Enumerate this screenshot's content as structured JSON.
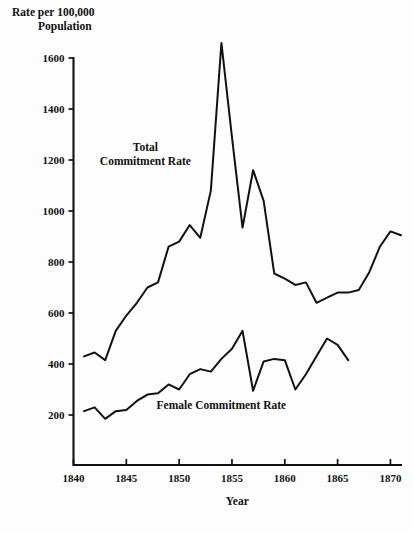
{
  "chart_data": {
    "type": "line",
    "title": "",
    "xlabel": "Year",
    "ylabel": "Rate per 100,000 Population",
    "ylabel_line1": "Rate per 100,000",
    "ylabel_line2": "Population",
    "xlim": [
      1840,
      1871
    ],
    "ylim": [
      100,
      1600
    ],
    "grid": false,
    "legend_position": "inline-annotation",
    "xticks": [
      1840,
      1845,
      1850,
      1855,
      1860,
      1865,
      1870
    ],
    "xtick_labels": [
      "1840",
      "1845",
      "1850",
      "1855",
      "1860",
      "1865",
      "1870"
    ],
    "yticks": [
      200,
      400,
      600,
      800,
      1000,
      1200,
      1400,
      1600
    ],
    "ytick_labels": [
      "200",
      "400",
      "600",
      "800",
      "1000",
      "1200",
      "1400",
      "1600"
    ],
    "line_color": "#111111",
    "series": [
      {
        "name": "Total Commitment Rate",
        "label_line1": "Total",
        "label_line2": "Commitment Rate",
        "label_x": 1846.8,
        "label_y": 1235,
        "x": [
          1841,
          1842,
          1843,
          1844,
          1845,
          1846,
          1847,
          1848,
          1849,
          1850,
          1851,
          1852,
          1853,
          1854,
          1855,
          1856,
          1857,
          1858,
          1859,
          1860,
          1861,
          1862,
          1863,
          1864,
          1865,
          1866,
          1867,
          1868,
          1869,
          1870,
          1871
        ],
        "values": [
          430,
          445,
          415,
          530,
          590,
          640,
          700,
          720,
          860,
          880,
          945,
          895,
          1080,
          1659,
          1290,
          935,
          1160,
          1040,
          755,
          735,
          710,
          720,
          640,
          660,
          680,
          680,
          690,
          760,
          860,
          920,
          905
        ]
      },
      {
        "name": "Female Commitment Rate",
        "label_line1": "Female Commitment Rate",
        "label_x": 1854.0,
        "label_y": 222,
        "x": [
          1841,
          1842,
          1843,
          1844,
          1845,
          1846,
          1847,
          1848,
          1849,
          1850,
          1851,
          1852,
          1853,
          1854,
          1855,
          1856,
          1857,
          1858,
          1859,
          1860,
          1861,
          1862,
          1863,
          1864,
          1865,
          1866
        ],
        "values": [
          215,
          230,
          185,
          215,
          220,
          255,
          280,
          285,
          320,
          300,
          360,
          380,
          370,
          420,
          460,
          530,
          295,
          410,
          420,
          415,
          300,
          360,
          430,
          500,
          475,
          415
        ]
      }
    ]
  }
}
